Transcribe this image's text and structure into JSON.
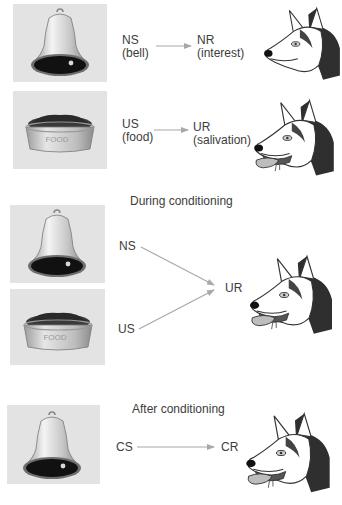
{
  "colors": {
    "panel_bg": "#e3e3e3",
    "arrow": "#a8a8a8",
    "text": "#3c3c3c",
    "dog_dark": "#2e2e2e"
  },
  "before": {
    "row1": {
      "stimulus_icon": "bell-icon",
      "stimulus_abbr": "NS",
      "stimulus_desc": "(bell)",
      "response_abbr": "NR",
      "response_desc": "(interest)",
      "dog_icon": "dog-head-alert-icon"
    },
    "row2": {
      "stimulus_icon": "food-bowl-icon",
      "bowl_text": "FOOD",
      "stimulus_abbr": "US",
      "stimulus_desc": "(food)",
      "response_abbr": "UR",
      "response_desc": "(salivation)",
      "dog_icon": "dog-head-salivating-icon"
    }
  },
  "during": {
    "heading": "During conditioning",
    "stimulus1_abbr": "NS",
    "stimulus2_abbr": "US",
    "response_abbr": "UR",
    "bowl_text": "FOOD"
  },
  "after": {
    "heading": "After conditioning",
    "stimulus_abbr": "CS",
    "response_abbr": "CR"
  }
}
